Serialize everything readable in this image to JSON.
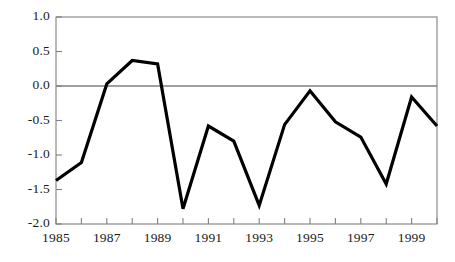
{
  "chart_data": {
    "type": "line",
    "title": "",
    "subtitle": "",
    "xlabel": "",
    "ylabel": "",
    "x": [
      1985,
      1986,
      1987,
      1988,
      1989,
      1990,
      1991,
      1992,
      1993,
      1994,
      1995,
      1996,
      1997,
      1998,
      1999,
      2000
    ],
    "values": [
      -1.37,
      -1.11,
      0.03,
      0.37,
      0.32,
      -1.78,
      -0.58,
      -0.8,
      -1.73,
      -0.56,
      -0.07,
      -0.52,
      -0.74,
      -1.42,
      -0.16,
      -0.58
    ],
    "series": [
      {
        "name": "series-1",
        "values": [
          -1.37,
          -1.11,
          0.03,
          0.37,
          0.32,
          -1.78,
          -0.58,
          -0.8,
          -1.73,
          -0.56,
          -0.07,
          -0.52,
          -0.74,
          -1.42,
          -0.16,
          -0.58
        ]
      }
    ],
    "xlim": [
      1985,
      2000
    ],
    "ylim": [
      -2.0,
      1.0
    ],
    "yticks": [
      1.0,
      0.5,
      0.0,
      -0.5,
      -1.0,
      -1.5,
      -2.0
    ],
    "ytick_labels": [
      "1.0",
      "0.5",
      "0.0",
      "-0.5",
      "-1.0",
      "-1.5",
      "-2.0"
    ],
    "xticks": [
      1985,
      1986,
      1987,
      1988,
      1989,
      1990,
      1991,
      1992,
      1993,
      1994,
      1995,
      1996,
      1997,
      1998,
      1999,
      2000
    ],
    "xtick_labels": [
      "1985",
      "",
      "1987",
      "",
      "1989",
      "",
      "1991",
      "",
      "1993",
      "",
      "1995",
      "",
      "1997",
      "",
      "1999",
      ""
    ],
    "grid": false,
    "zero_line": true,
    "legend": null,
    "legend_position": "none",
    "annotations": [],
    "colors": {
      "line": "#000000",
      "frame": "#808080",
      "zero_line": "#808080",
      "tick": "#808080",
      "text": "#1a1a1a",
      "background": "#ffffff"
    },
    "line_width": 3.2
  },
  "axis": {
    "y_labels": [
      "1.0",
      "0.5",
      "0.0",
      "-0.5",
      "-1.0",
      "-1.5",
      "-2.0"
    ],
    "x_labels": [
      "1985",
      "1987",
      "1989",
      "1991",
      "1993",
      "1995",
      "1997",
      "1999"
    ]
  }
}
